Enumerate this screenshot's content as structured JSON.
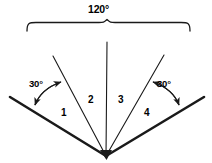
{
  "figure": {
    "type": "geometry-diagram",
    "stroke_color": "#1a1a1a",
    "background_color": "#ffffff",
    "vertex": {
      "x": 106,
      "y": 157,
      "label": "vertex"
    },
    "span_brace": {
      "value": "120°",
      "left_x": 27,
      "right_x": 190,
      "y": 30,
      "peak_x": 107,
      "peak_y": 20
    },
    "angle_marks": [
      {
        "id": "left",
        "value": "30°",
        "from_x": 34,
        "from_y": 106,
        "to_x": 62,
        "to_y": 81
      },
      {
        "id": "right",
        "value": "30°",
        "from_x": 152,
        "from_y": 81,
        "to_x": 180,
        "to_y": 106
      }
    ],
    "regions": [
      {
        "id": "1",
        "label": "1",
        "value": "30°"
      },
      {
        "id": "2",
        "label": "2",
        "value": "30°"
      },
      {
        "id": "3",
        "label": "3",
        "value": "30°"
      },
      {
        "id": "4",
        "label": "4",
        "value": "30°"
      }
    ],
    "rays": [
      {
        "id": "outer-left",
        "x": 10,
        "y": 97,
        "weight": "thick"
      },
      {
        "id": "inner-left",
        "x": 53,
        "y": 56,
        "weight": "thin"
      },
      {
        "id": "middle-vertical",
        "x": 107,
        "y": 42,
        "weight": "thin"
      },
      {
        "id": "inner-right",
        "x": 164,
        "y": 55,
        "weight": "thin"
      },
      {
        "id": "outer-right",
        "x": 204,
        "y": 97,
        "weight": "thick"
      }
    ]
  }
}
